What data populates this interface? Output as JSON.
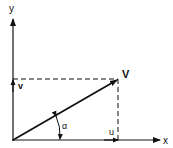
{
  "diagram": {
    "title": "",
    "axes": {
      "x_label": "x",
      "y_label": "y"
    },
    "vector": {
      "label": "V",
      "x_component_label": "u",
      "y_component_label": "v",
      "angle_label": "α"
    },
    "colors": {
      "line": "#111111",
      "background": "#ffffff"
    }
  }
}
